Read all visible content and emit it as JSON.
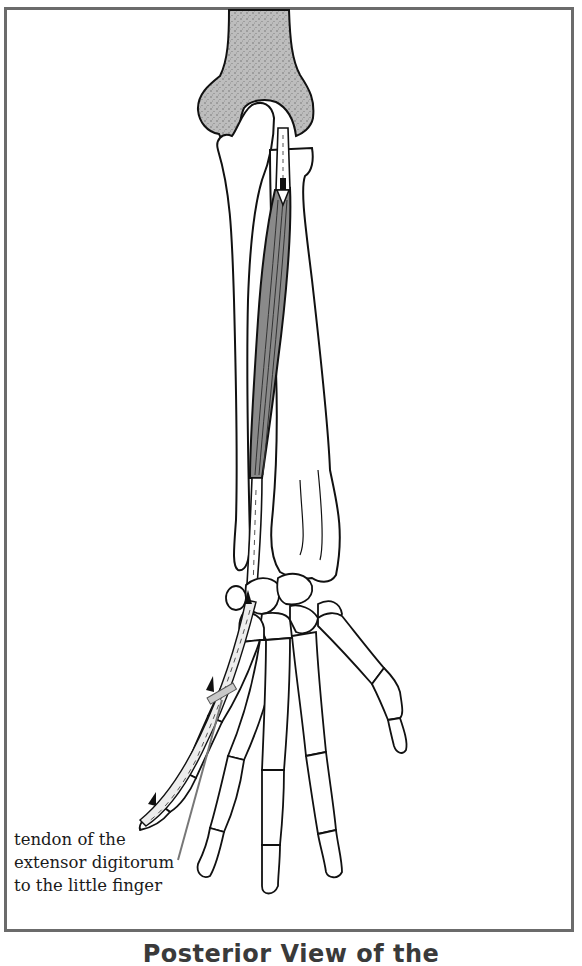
{
  "figure": {
    "view": "Posterior View of the",
    "caption": "Posterior View of the",
    "caption_truncated": true,
    "labels": [
      {
        "id": "extensor-digitorum-tendon-little-finger",
        "lines": [
          "tendon of the",
          "extensor digitorum",
          "to the little finger"
        ]
      }
    ],
    "structures": [
      "humerus-distal-end",
      "ulna",
      "radius",
      "extensor-digitorum-muscle-belly",
      "extensor-digitorum-tendon",
      "carpal-bones",
      "metacarpals",
      "phalanges",
      "thumb"
    ],
    "arrows": [
      {
        "direction": "down",
        "location": "origin near elbow"
      },
      {
        "direction": "up",
        "location": "wrist"
      },
      {
        "direction": "up",
        "location": "little finger proximal"
      },
      {
        "direction": "up",
        "location": "little finger distal"
      }
    ],
    "colors": {
      "frame": "#6b6b6b",
      "humerus_fill": "#b9b9b9",
      "muscle_fill": "#8a8a8a",
      "outline": "#111111",
      "leader_line": "#777777",
      "tendon_highlight": "#c9c9c9"
    }
  }
}
